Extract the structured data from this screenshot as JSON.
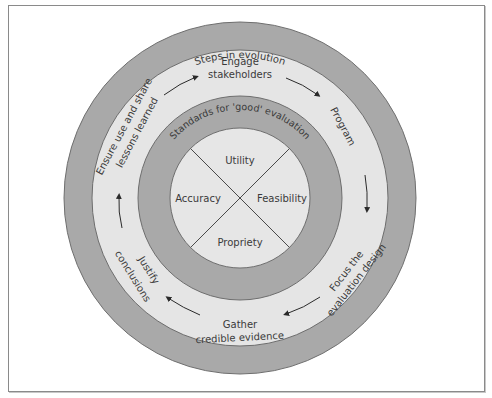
{
  "diagram": {
    "outer_ring_label": "Steps in evolution",
    "inner_ring_label": "Standards for 'good' evaluation",
    "steps": [
      {
        "id": "engage",
        "lines": [
          "Engage",
          "stakeholders"
        ]
      },
      {
        "id": "program",
        "lines": [
          "Program"
        ]
      },
      {
        "id": "focus",
        "lines": [
          "Focus the",
          "evaluation design"
        ]
      },
      {
        "id": "gather",
        "lines": [
          "Gather",
          "credible evidence"
        ]
      },
      {
        "id": "justify",
        "lines": [
          "Justify",
          "conclusions"
        ]
      },
      {
        "id": "ensure",
        "lines": [
          "Ensure use and share",
          "lessons learned"
        ]
      }
    ],
    "standards": {
      "top": "Utility",
      "right": "Feasibility",
      "bottom": "Propriety",
      "left": "Accuracy"
    },
    "colors": {
      "outer_ring": "#a9a9a9",
      "steps_ring": "#e5e5e5",
      "standards_ring": "#a9a9a9",
      "center": "#e6e6e6",
      "text": "#3a3a3a",
      "stroke": "#6e6e6e"
    }
  }
}
